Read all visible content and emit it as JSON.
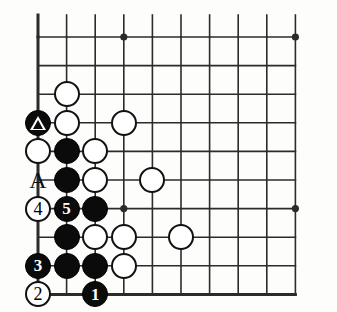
{
  "diagram": {
    "type": "go-board-problem",
    "board_size": 19,
    "view": "bottom-left-corner",
    "colors": {
      "line": "#2b2b2b",
      "board_background": "#fdfdfb",
      "black_stone": "#0b0b0b",
      "white_stone": "#ffffff",
      "stone_outline": "#111111"
    },
    "geometry": {
      "origin_x": 38,
      "origin_y": 37,
      "spacing_x": 28.6,
      "spacing_y": 28.6,
      "cols": 10,
      "rows": 9,
      "stone_radius": 13,
      "edge_left_px": 38,
      "edge_bottom_px": 287,
      "edge_right_px": 306,
      "edge_top_px": 37
    },
    "star_points": [
      {
        "col": 3,
        "row": 0
      },
      {
        "col": 9,
        "row": 0
      },
      {
        "col": 3,
        "row": 6
      },
      {
        "col": 9,
        "row": 6
      }
    ],
    "stones": [
      {
        "col": 1,
        "row": 2,
        "color": "white",
        "label": "",
        "marker": ""
      },
      {
        "col": 0,
        "row": 3,
        "color": "black",
        "label": "",
        "marker": "triangle"
      },
      {
        "col": 1,
        "row": 3,
        "color": "white",
        "label": "",
        "marker": ""
      },
      {
        "col": 3,
        "row": 3,
        "color": "white",
        "label": "",
        "marker": ""
      },
      {
        "col": 0,
        "row": 4,
        "color": "white",
        "label": "",
        "marker": ""
      },
      {
        "col": 1,
        "row": 4,
        "color": "black",
        "label": "",
        "marker": ""
      },
      {
        "col": 2,
        "row": 4,
        "color": "white",
        "label": "",
        "marker": ""
      },
      {
        "col": 1,
        "row": 5,
        "color": "black",
        "label": "",
        "marker": ""
      },
      {
        "col": 2,
        "row": 5,
        "color": "white",
        "label": "",
        "marker": ""
      },
      {
        "col": 4,
        "row": 5,
        "color": "white",
        "label": "",
        "marker": ""
      },
      {
        "col": 0,
        "row": 6,
        "color": "white",
        "label": "4",
        "marker": ""
      },
      {
        "col": 1,
        "row": 6,
        "color": "black",
        "label": "5",
        "marker": ""
      },
      {
        "col": 2,
        "row": 6,
        "color": "black",
        "label": "",
        "marker": ""
      },
      {
        "col": 1,
        "row": 7,
        "color": "black",
        "label": "",
        "marker": ""
      },
      {
        "col": 2,
        "row": 7,
        "color": "white",
        "label": "",
        "marker": ""
      },
      {
        "col": 3,
        "row": 7,
        "color": "white",
        "label": "",
        "marker": ""
      },
      {
        "col": 5,
        "row": 7,
        "color": "white",
        "label": "",
        "marker": ""
      },
      {
        "col": 0,
        "row": 8,
        "color": "black",
        "label": "3",
        "marker": ""
      },
      {
        "col": 1,
        "row": 8,
        "color": "black",
        "label": "",
        "marker": ""
      },
      {
        "col": 2,
        "row": 8,
        "color": "black",
        "label": "",
        "marker": ""
      },
      {
        "col": 3,
        "row": 8,
        "color": "white",
        "label": "",
        "marker": ""
      },
      {
        "col": 0,
        "row": 9,
        "color": "white",
        "label": "2",
        "marker": ""
      },
      {
        "col": 2,
        "row": 9,
        "color": "black",
        "label": "1",
        "marker": ""
      }
    ],
    "point_labels": [
      {
        "col": 0,
        "row": 5,
        "text": "A"
      }
    ],
    "move_sequence": [
      "1",
      "2",
      "3",
      "4",
      "5"
    ],
    "marked_stone_symbol": "triangle"
  }
}
